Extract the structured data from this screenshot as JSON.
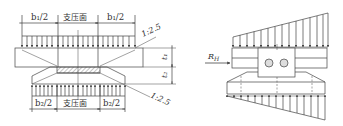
{
  "figure": {
    "left_diagram": {
      "title": "bearing pressure distribution - uniform",
      "top_dimensions": [
        {
          "label": "b₁/2"
        },
        {
          "label": "支压面"
        },
        {
          "label": "b₁/2"
        }
      ],
      "bottom_dimensions": [
        {
          "label": "b₂/2"
        },
        {
          "label": "支压面"
        },
        {
          "label": "b₂/2"
        }
      ],
      "slope_top": "1:2.5",
      "slope_bottom": "1:2.5",
      "thickness_top": "t₁",
      "thickness_bottom": "t₂"
    },
    "right_diagram": {
      "title": "bearing pressure distribution - triangular",
      "horizontal_force": "R",
      "horizontal_force_sub": "H"
    },
    "colors": {
      "line": "#444444",
      "background": "#ffffff"
    }
  }
}
